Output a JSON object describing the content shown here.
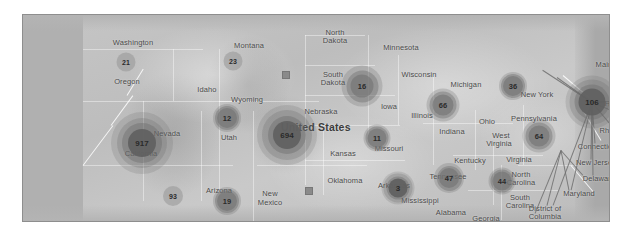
{
  "map": {
    "title": "United States",
    "country_label": "United States",
    "background_color": "#bdbdbd",
    "border_color": "#8e8e8e",
    "ocean_color": "#b0b0b0",
    "cluster_dark_color": "#525252",
    "cluster_light_color": "#969696",
    "label_color": "#4a4a4a"
  },
  "state_labels": [
    {
      "name": "Washington",
      "x": 110,
      "y": 24
    },
    {
      "name": "Montana",
      "x": 226,
      "y": 27
    },
    {
      "name": "North",
      "x": 312,
      "y": 14
    },
    {
      "name": "Dakota",
      "x": 312,
      "y": 22
    },
    {
      "name": "Minnesota",
      "x": 378,
      "y": 29
    },
    {
      "name": "Oregon",
      "x": 104,
      "y": 63
    },
    {
      "name": "Idaho",
      "x": 184,
      "y": 71
    },
    {
      "name": "South",
      "x": 310,
      "y": 56
    },
    {
      "name": "Dakota",
      "x": 310,
      "y": 64
    },
    {
      "name": "Wisconsin",
      "x": 396,
      "y": 56
    },
    {
      "name": "Michigan",
      "x": 443,
      "y": 66
    },
    {
      "name": "New York",
      "x": 514,
      "y": 76
    },
    {
      "name": "Maine",
      "x": 583,
      "y": 46
    },
    {
      "name": "N",
      "x": 613,
      "y": 12
    },
    {
      "name": "Brun",
      "x": 607,
      "y": 20
    },
    {
      "name": "Wyoming",
      "x": 224,
      "y": 81
    },
    {
      "name": "Nebraska",
      "x": 298,
      "y": 93
    },
    {
      "name": "Iowa",
      "x": 366,
      "y": 88
    },
    {
      "name": "Illinois",
      "x": 399,
      "y": 97
    },
    {
      "name": "Ohio",
      "x": 464,
      "y": 103
    },
    {
      "name": "Pennsylvania",
      "x": 511,
      "y": 100
    },
    {
      "name": "Har",
      "x": 588,
      "y": 85
    },
    {
      "name": "Mass",
      "x": 600,
      "y": 99
    },
    {
      "name": "Nevada",
      "x": 144,
      "y": 115
    },
    {
      "name": "Utah",
      "x": 206,
      "y": 119
    },
    {
      "name": "Indiana",
      "x": 429,
      "y": 113
    },
    {
      "name": "Rhode Is",
      "x": 592,
      "y": 112
    },
    {
      "name": "Connecticut",
      "x": 575,
      "y": 128
    },
    {
      "name": "California",
      "x": 118,
      "y": 135
    },
    {
      "name": "Kansas",
      "x": 320,
      "y": 135
    },
    {
      "name": "Missouri",
      "x": 366,
      "y": 130
    },
    {
      "name": "West",
      "x": 478,
      "y": 117
    },
    {
      "name": "Virginia",
      "x": 476,
      "y": 125
    },
    {
      "name": "Kentucky",
      "x": 447,
      "y": 142
    },
    {
      "name": "Virginia",
      "x": 496,
      "y": 141
    },
    {
      "name": "New Jersey",
      "x": 573,
      "y": 144
    },
    {
      "name": "Delaware",
      "x": 576,
      "y": 160
    },
    {
      "name": "Oklahoma",
      "x": 322,
      "y": 162
    },
    {
      "name": "Arkansas",
      "x": 371,
      "y": 167
    },
    {
      "name": "Tennessee",
      "x": 425,
      "y": 158
    },
    {
      "name": "North",
      "x": 498,
      "y": 156
    },
    {
      "name": "Carolina",
      "x": 498,
      "y": 164
    },
    {
      "name": "Maryland",
      "x": 556,
      "y": 175
    },
    {
      "name": "Arizona",
      "x": 196,
      "y": 172
    },
    {
      "name": "New",
      "x": 247,
      "y": 175
    },
    {
      "name": "Mexico",
      "x": 247,
      "y": 184
    },
    {
      "name": "Mississippi",
      "x": 397,
      "y": 182
    },
    {
      "name": "Alabama",
      "x": 428,
      "y": 194
    },
    {
      "name": "South",
      "x": 497,
      "y": 179
    },
    {
      "name": "Carolina",
      "x": 497,
      "y": 187
    },
    {
      "name": "Georgia",
      "x": 463,
      "y": 200
    },
    {
      "name": "District of",
      "x": 522,
      "y": 190
    },
    {
      "name": "Columbia",
      "x": 522,
      "y": 198
    },
    {
      "name": "Texas",
      "x": 307,
      "y": 206
    },
    {
      "name": "Louisi",
      "x": 386,
      "y": 216
    }
  ],
  "clusters": [
    {
      "value": "21",
      "x": 103,
      "y": 47,
      "size": 19,
      "style": "small",
      "halo": 0
    },
    {
      "value": "23",
      "x": 210,
      "y": 46,
      "size": 19,
      "style": "small",
      "halo": 0
    },
    {
      "value": "16",
      "x": 339,
      "y": 71,
      "size": 23,
      "style": "medium",
      "halo": 9
    },
    {
      "value": "36",
      "x": 490,
      "y": 71,
      "size": 20,
      "style": "medium",
      "halo": 4
    },
    {
      "value": "106",
      "x": 569,
      "y": 87,
      "size": 27,
      "style": "large",
      "halo": 13
    },
    {
      "value": "12",
      "x": 204,
      "y": 103,
      "size": 20,
      "style": "medium",
      "halo": 4
    },
    {
      "value": "66",
      "x": 420,
      "y": 90,
      "size": 21,
      "style": "medium",
      "halo": 6
    },
    {
      "value": "694",
      "x": 264,
      "y": 120,
      "size": 28,
      "style": "large",
      "halo": 16
    },
    {
      "value": "11",
      "x": 354,
      "y": 123,
      "size": 19,
      "style": "medium",
      "halo": 4
    },
    {
      "value": "64",
      "x": 516,
      "y": 121,
      "size": 21,
      "style": "medium",
      "halo": 6
    },
    {
      "value": "917",
      "x": 119,
      "y": 128,
      "size": 28,
      "style": "large",
      "halo": 17
    },
    {
      "value": "47",
      "x": 426,
      "y": 163,
      "size": 20,
      "style": "medium",
      "halo": 5
    },
    {
      "value": "44",
      "x": 479,
      "y": 166,
      "size": 19,
      "style": "medium",
      "halo": 4
    },
    {
      "value": "93",
      "x": 150,
      "y": 181,
      "size": 20,
      "style": "small",
      "halo": 0
    },
    {
      "value": "3",
      "x": 375,
      "y": 173,
      "size": 19,
      "style": "large",
      "halo": 7
    },
    {
      "value": "19",
      "x": 204,
      "y": 186,
      "size": 20,
      "style": "medium",
      "halo": 4
    }
  ],
  "markers": [
    {
      "name": "marker-south-dakota",
      "x": 263,
      "y": 60
    },
    {
      "name": "marker-oklahoma",
      "x": 286,
      "y": 176
    }
  ]
}
